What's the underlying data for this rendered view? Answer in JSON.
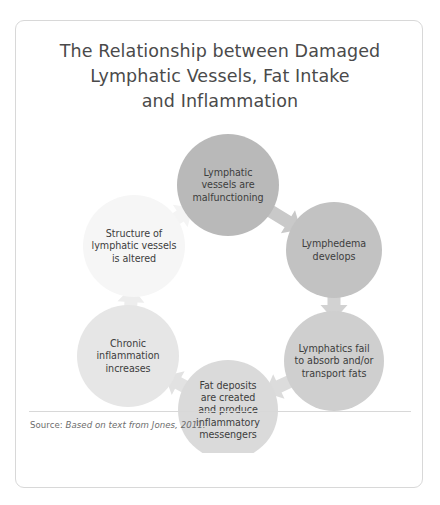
{
  "figure": {
    "title_lines": [
      "The Relationship between Damaged",
      "Lymphatic Vessels, Fat Intake",
      "and Inflammation"
    ],
    "source": {
      "label": "Source: ",
      "reference": "Based on text from Jones, 2011."
    },
    "colors": {
      "border": "#d8d8d8",
      "title_text": "#4a4a4a",
      "node_text": "#3d3d3d",
      "source_text": "#6d6d6d",
      "background": "#ffffff"
    }
  },
  "chart_data": {
    "type": "diagram",
    "subtype": "cycle-flow",
    "title": "The Relationship between Damaged Lymphatic Vessels, Fat Intake and Inflammation",
    "direction": "clockwise",
    "node_count": 6,
    "nodes": [
      {
        "id": "node-1",
        "order": 1,
        "name": "lymphatic-vessels-malfunctioning",
        "lines": [
          "Lymphatic",
          "vessels are",
          "malfunctioning"
        ],
        "text": "Lymphatic vessels are malfunctioning",
        "cx": 212,
        "cy": 72,
        "r": 51,
        "fill": "#b9b9b9"
      },
      {
        "id": "node-2",
        "order": 2,
        "name": "lymphedema-develops",
        "lines": [
          "Lymphedema",
          "develops"
        ],
        "text": "Lymphedema develops",
        "cx": 318,
        "cy": 137,
        "r": 48,
        "fill": "#c2c2c2"
      },
      {
        "id": "node-3",
        "order": 3,
        "name": "lymphatics-fail-absorb-transport-fats",
        "lines": [
          "Lymphatics fail",
          "to absorb and/or",
          "transport fats"
        ],
        "text": "Lymphatics fail to absorb and/or transport fats",
        "cx": 318,
        "cy": 248,
        "r": 50,
        "fill": "#cfcfcf"
      },
      {
        "id": "node-4",
        "order": 4,
        "name": "fat-deposits-inflammatory-messengers",
        "lines": [
          "Fat deposits",
          "are created",
          "and produce",
          "inflammatory",
          "messengers"
        ],
        "text": "Fat deposits are created and produce inflammatory messengers",
        "cx": 212,
        "cy": 297,
        "r": 50,
        "fill": "#dadada"
      },
      {
        "id": "node-5",
        "order": 5,
        "name": "chronic-inflammation-increases",
        "lines": [
          "Chronic",
          "inflammation",
          "increases"
        ],
        "text": "Chronic inflammation increases",
        "cx": 112,
        "cy": 243,
        "r": 51,
        "fill": "#e6e6e6"
      },
      {
        "id": "node-6",
        "order": 6,
        "name": "structure-of-lymphatic-vessels-altered",
        "lines": [
          "Structure of",
          "lymphatic vessels",
          "is altered"
        ],
        "text": "Structure of lymphatic vessels is altered",
        "cx": 118,
        "cy": 133,
        "r": 51,
        "fill": "#f6f6f6"
      }
    ],
    "arrows": [
      {
        "id": "arrow-1",
        "from": "node-1",
        "to": "node-2",
        "direction": "down-right",
        "fill": "#c9c9c9"
      },
      {
        "id": "arrow-2",
        "from": "node-2",
        "to": "node-3",
        "direction": "down",
        "fill": "#d2d2d2"
      },
      {
        "id": "arrow-3",
        "from": "node-3",
        "to": "node-4",
        "direction": "down-left",
        "fill": "#dcdcdc"
      },
      {
        "id": "arrow-4",
        "from": "node-4",
        "to": "node-5",
        "direction": "left",
        "fill": "#e2e2e2"
      },
      {
        "id": "arrow-5",
        "from": "node-5",
        "to": "node-6",
        "direction": "up",
        "fill": "#ededed"
      },
      {
        "id": "arrow-6",
        "from": "node-6",
        "to": "node-1",
        "direction": "up-right",
        "fill": "#f4f4f4"
      }
    ]
  }
}
